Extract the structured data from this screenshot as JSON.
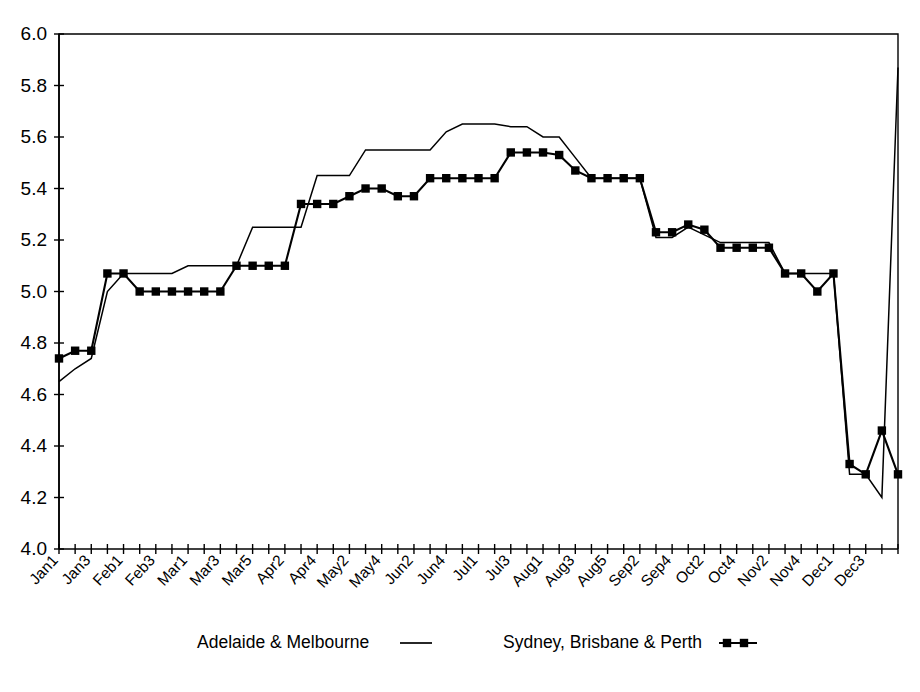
{
  "chart_data": {
    "type": "line",
    "title": "",
    "subtitle": "",
    "xlabel": "",
    "ylabel": "",
    "ylim": [
      4.0,
      6.0
    ],
    "ytick_step": 0.2,
    "ytick_labels": [
      "4.0",
      "4.2",
      "4.4",
      "4.6",
      "4.8",
      "5.0",
      "5.2",
      "5.4",
      "5.6",
      "5.8",
      "6.0"
    ],
    "grid": false,
    "legend_position": "bottom",
    "x": [
      "Jan1",
      "Jan2",
      "Jan3",
      "Jan4",
      "Feb1",
      "Feb2",
      "Feb3",
      "Feb4",
      "Mar1",
      "Mar2",
      "Mar3",
      "Mar4",
      "Mar5",
      "Apr1",
      "Apr2",
      "Apr3",
      "Apr4",
      "May1",
      "May2",
      "May3",
      "May4",
      "May5",
      "Jun2",
      "Jun3",
      "Jun4",
      "Jun5",
      "Jul1",
      "Jul2",
      "Jul3",
      "Jul4",
      "Aug1",
      "Aug2",
      "Aug3",
      "Aug4",
      "Aug5",
      "Sep1",
      "Sep2",
      "Sep3",
      "Sep4",
      "Sep5",
      "Oct2",
      "Oct3",
      "Oct4",
      "Oct5",
      "Nov2",
      "Nov3",
      "Nov4",
      "Nov5",
      "Dec1",
      "Dec2",
      "Dec3",
      "Dec4",
      "Dec5"
    ],
    "xtick_labels_shown": [
      "Jan1",
      "Jan3",
      "Feb1",
      "Feb3",
      "Mar1",
      "Mar3",
      "Mar5",
      "Apr2",
      "Apr4",
      "May2",
      "May4",
      "Jun2",
      "Jun4",
      "Jul1",
      "Jul3",
      "Aug1",
      "Aug3",
      "Aug5",
      "Sep2",
      "Sep4",
      "Oct2",
      "Oct4",
      "Nov2",
      "Nov4",
      "Dec1",
      "Dec3"
    ],
    "xtick_label_every": 2,
    "series": [
      {
        "name": "Adelaide & Melbourne",
        "style": "plain-line",
        "marker": "none",
        "color": "#000000",
        "values": [
          4.65,
          4.7,
          4.74,
          5.0,
          5.07,
          5.07,
          5.07,
          5.07,
          5.1,
          5.1,
          5.1,
          5.1,
          5.25,
          5.25,
          5.25,
          5.25,
          5.45,
          5.45,
          5.45,
          5.55,
          5.55,
          5.55,
          5.55,
          5.55,
          5.62,
          5.65,
          5.65,
          5.65,
          5.64,
          5.64,
          5.6,
          5.6,
          5.52,
          5.44,
          5.44,
          5.44,
          5.44,
          5.21,
          5.21,
          5.25,
          5.22,
          5.19,
          5.19,
          5.19,
          5.19,
          5.07,
          5.07,
          5.07,
          5.07,
          4.29,
          4.29,
          4.2,
          5.87
        ]
      },
      {
        "name": "Sydney, Brisbane & Perth",
        "style": "line-with-square-markers",
        "marker": "square",
        "color": "#000000",
        "values": [
          4.74,
          4.77,
          4.77,
          5.07,
          5.07,
          5.0,
          5.0,
          5.0,
          5.0,
          5.0,
          5.0,
          5.1,
          5.1,
          5.1,
          5.1,
          5.34,
          5.34,
          5.34,
          5.37,
          5.4,
          5.4,
          5.37,
          5.37,
          5.44,
          5.44,
          5.44,
          5.44,
          5.44,
          5.54,
          5.54,
          5.54,
          5.53,
          5.47,
          5.44,
          5.44,
          5.44,
          5.44,
          5.23,
          5.23,
          5.26,
          5.24,
          5.17,
          5.17,
          5.17,
          5.17,
          5.07,
          5.07,
          5.0,
          5.07,
          4.33,
          4.29,
          4.46,
          4.29
        ]
      }
    ],
    "legend": [
      {
        "label": "Adelaide & Melbourne",
        "marker": "line"
      },
      {
        "label": "Sydney, Brisbane & Perth",
        "marker": "line-squares"
      }
    ]
  }
}
